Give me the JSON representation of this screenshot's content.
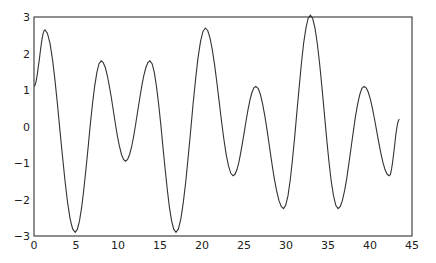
{
  "chart_data": {
    "type": "line",
    "title": "",
    "xlabel": "",
    "ylabel": "",
    "xlim": [
      0,
      45
    ],
    "ylim": [
      -3,
      3
    ],
    "grid": false,
    "legend": null,
    "x_ticks": [
      0,
      5,
      10,
      15,
      20,
      25,
      30,
      35,
      40,
      45
    ],
    "y_ticks": [
      -3,
      -2,
      -1,
      0,
      1,
      2,
      3
    ],
    "x_tick_labels": [
      "0",
      "5",
      "10",
      "15",
      "20",
      "25",
      "30",
      "35",
      "40",
      "45"
    ],
    "y_tick_labels": [
      "-3",
      "-2",
      "-1",
      "0",
      "1",
      "2",
      "3"
    ],
    "series": [
      {
        "name": "signal",
        "color": "#333333",
        "key_points": [
          [
            0.0,
            1.1
          ],
          [
            1.3,
            2.65
          ],
          [
            4.9,
            -2.9
          ],
          [
            8.0,
            1.8
          ],
          [
            10.9,
            -0.95
          ],
          [
            13.8,
            1.8
          ],
          [
            16.9,
            -2.9
          ],
          [
            20.4,
            2.7
          ],
          [
            23.7,
            -1.35
          ],
          [
            26.4,
            1.1
          ],
          [
            29.7,
            -2.25
          ],
          [
            32.9,
            3.05
          ],
          [
            36.2,
            -2.25
          ],
          [
            39.3,
            1.1
          ],
          [
            42.3,
            -1.35
          ],
          [
            43.5,
            0.2
          ]
        ]
      }
    ]
  }
}
